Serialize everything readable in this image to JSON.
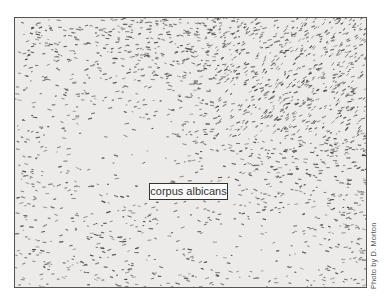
{
  "figure": {
    "type": "micrograph",
    "label": "corpus albicans",
    "credit": "Photo by D. Morton",
    "colors": {
      "background": "#ecebe9",
      "cells": "#6b6b6b",
      "frame": "#555555",
      "label_box_bg": "#fbfbfb"
    }
  }
}
